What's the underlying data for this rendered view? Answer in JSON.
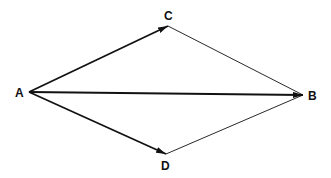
{
  "diagram": {
    "title": "",
    "colors": {
      "stroke": "#111111",
      "background": "#ffffff"
    },
    "nodes": [
      {
        "id": "A",
        "label": "A",
        "x": 29,
        "y": 92
      },
      {
        "id": "C",
        "label": "C",
        "x": 168,
        "y": 26
      },
      {
        "id": "B",
        "label": "B",
        "x": 303,
        "y": 95
      },
      {
        "id": "D",
        "label": "D",
        "x": 166,
        "y": 154
      }
    ],
    "edges": [
      {
        "from": "A",
        "to": "C",
        "arrow": true,
        "weight": "bold"
      },
      {
        "from": "A",
        "to": "B",
        "arrow": true,
        "weight": "bold"
      },
      {
        "from": "A",
        "to": "D",
        "arrow": true,
        "weight": "bold"
      },
      {
        "from": "C",
        "to": "B",
        "arrow": false,
        "weight": "thin"
      },
      {
        "from": "D",
        "to": "B",
        "arrow": false,
        "weight": "thin"
      }
    ]
  }
}
